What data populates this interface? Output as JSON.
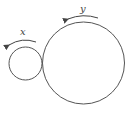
{
  "diagram": {
    "colors": {
      "stroke": "#555555",
      "background": "#ffffff",
      "text": "#444444"
    },
    "circles": [
      {
        "name": "small-circle",
        "cx": 25.5,
        "cy": 63.5,
        "r": 16.5,
        "label": "x"
      },
      {
        "name": "large-circle",
        "cx": 83.5,
        "cy": 63,
        "r": 41,
        "label": "y"
      }
    ],
    "labels": {
      "x": "x",
      "y": "y"
    },
    "arrows": [
      {
        "name": "x-rotation-arrow",
        "direction": "counterclockwise"
      },
      {
        "name": "y-rotation-arrow",
        "direction": "counterclockwise"
      }
    ]
  }
}
